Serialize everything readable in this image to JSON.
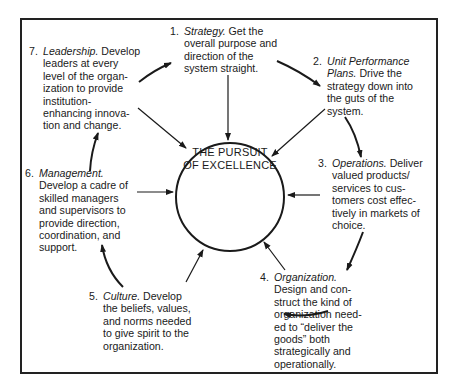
{
  "diagram": {
    "center_label": [
      "THE PURSUIT",
      "OF EXCELLENCE"
    ],
    "items": [
      {
        "number": "1.",
        "title": "Strategy.",
        "text_lines": [
          " Get the",
          "overall purpose and",
          "direction of the",
          "system straight."
        ]
      },
      {
        "number": "2.",
        "title": "Unit Performance",
        "title2": "Plans.",
        "text_lines": [
          " Drive the",
          "strategy down into",
          "the guts of the",
          "system."
        ]
      },
      {
        "number": "3.",
        "title": "Operations.",
        "text_lines": [
          " Deliver",
          "valued products/",
          "services to cus-",
          "tomers cost effec-",
          "tively in markets of",
          "choice."
        ]
      },
      {
        "number": "4.",
        "title": "Organization.",
        "text_lines": [
          "Design and con-",
          "struct the kind of",
          "organization need-",
          "ed to “deliver the",
          "goods” both",
          "strategically and",
          "operationally."
        ]
      },
      {
        "number": "5.",
        "title": "Culture.",
        "text_lines": [
          " Develop",
          "the beliefs, values,",
          "and norms needed",
          "to give spirit to the",
          "organization."
        ]
      },
      {
        "number": "6.",
        "title": "Management.",
        "text_lines": [
          "Develop a cadre of",
          "skilled managers",
          "and supervisors to",
          "provide direction,",
          "coordination, and",
          "support."
        ]
      },
      {
        "number": "7.",
        "title": "Leadership.",
        "text_lines": [
          " Develop",
          "leaders at every",
          "level of the organ-",
          "ization to provide",
          "institution-",
          "enhancing innova-",
          "tion and change."
        ]
      }
    ],
    "colors": {
      "line": "#1a1a1a",
      "background": "#ffffff"
    }
  }
}
